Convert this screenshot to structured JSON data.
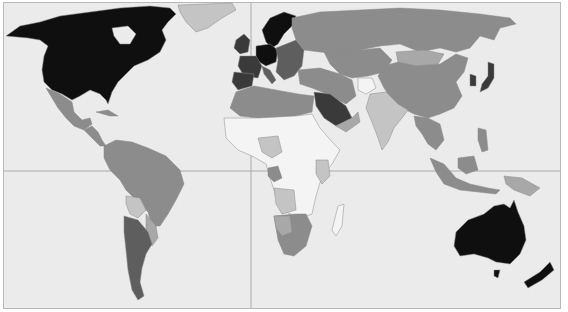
{
  "map": {
    "type": "choropleth-world",
    "background": "#ebebeb",
    "grid_color": "#9a9a9a",
    "border_color": "#8a8a8a",
    "legend": null,
    "title": null,
    "shade_levels": {
      "darkest": "#0f0f0f",
      "very_dark": "#3a3a3a",
      "dark": "#5e5e5e",
      "medium": "#8c8c8c",
      "medium_light": "#a8a8a8",
      "light": "#c4c4c4",
      "lightest": "#f4f4f4"
    },
    "regions": [
      {
        "name": "Canada/USA",
        "shade": "darkest"
      },
      {
        "name": "Greenland",
        "shade": "light"
      },
      {
        "name": "Mexico",
        "shade": "medium"
      },
      {
        "name": "Central America",
        "shade": "medium"
      },
      {
        "name": "Cuba",
        "shade": "medium"
      },
      {
        "name": "Colombia/Venezuela",
        "shade": "medium"
      },
      {
        "name": "Brazil",
        "shade": "medium"
      },
      {
        "name": "Peru",
        "shade": "medium"
      },
      {
        "name": "Bolivia",
        "shade": "light"
      },
      {
        "name": "Argentina/Chile",
        "shade": "dark"
      },
      {
        "name": "Paraguay/Uruguay",
        "shade": "medium_light"
      },
      {
        "name": "Western Europe",
        "shade": "very_dark"
      },
      {
        "name": "Germany/Benelux/Scandinavia",
        "shade": "darkest"
      },
      {
        "name": "Eastern Europe",
        "shade": "dark"
      },
      {
        "name": "Russia",
        "shade": "medium"
      },
      {
        "name": "Central Asia",
        "shade": "medium"
      },
      {
        "name": "Mongolia",
        "shade": "medium_light"
      },
      {
        "name": "China",
        "shade": "medium"
      },
      {
        "name": "Korea",
        "shade": "very_dark"
      },
      {
        "name": "Japan",
        "shade": "very_dark"
      },
      {
        "name": "Middle East",
        "shade": "medium"
      },
      {
        "name": "Saudi Arabia",
        "shade": "very_dark"
      },
      {
        "name": "Afghanistan",
        "shade": "lightest"
      },
      {
        "name": "India",
        "shade": "light"
      },
      {
        "name": "Southeast Asia",
        "shade": "medium"
      },
      {
        "name": "Indonesia",
        "shade": "medium"
      },
      {
        "name": "North Africa",
        "shade": "medium"
      },
      {
        "name": "Sub-Saharan Africa",
        "shade": "lightest"
      },
      {
        "name": "Southern Africa",
        "shade": "medium"
      },
      {
        "name": "Madagascar",
        "shade": "lightest"
      },
      {
        "name": "Australia",
        "shade": "darkest"
      },
      {
        "name": "New Zealand",
        "shade": "darkest"
      }
    ]
  }
}
